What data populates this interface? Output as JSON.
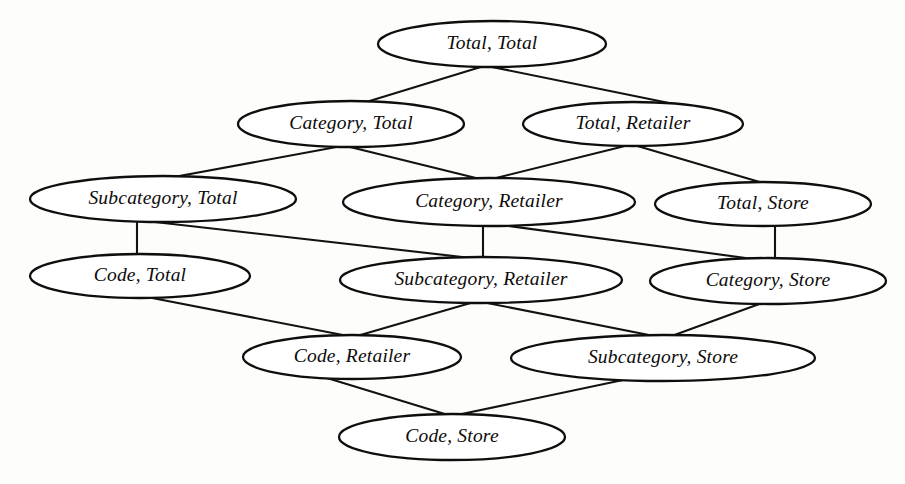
{
  "diagram": {
    "type": "lattice-dag",
    "orientation": "top-down",
    "background_color": "#fdfdfb",
    "node_fill": "#ffffff",
    "node_stroke": "#100e0c",
    "edge_stroke": "#14120f",
    "node_shape": "ellipse",
    "text_style": "italic-serif",
    "levels": 6,
    "node_count": 12,
    "edge_count": 17,
    "dimensions": [
      "Product",
      "Location"
    ],
    "nodes": [
      {
        "id": "total-total",
        "label": "Total, Total",
        "level": 0,
        "cx": 492,
        "cy": 44,
        "rx": 114,
        "ry": 23
      },
      {
        "id": "category-total",
        "label": "Category, Total",
        "level": 1,
        "cx": 351,
        "cy": 124,
        "rx": 113,
        "ry": 23
      },
      {
        "id": "total-retailer",
        "label": "Total, Retailer",
        "level": 1,
        "cx": 633,
        "cy": 124,
        "rx": 110,
        "ry": 22
      },
      {
        "id": "subcategory-total",
        "label": "Subcategory, Total",
        "level": 2,
        "cx": 163,
        "cy": 199,
        "rx": 133,
        "ry": 23
      },
      {
        "id": "category-retailer",
        "label": "Category, Retailer",
        "level": 2,
        "cx": 489,
        "cy": 202,
        "rx": 146,
        "ry": 24
      },
      {
        "id": "total-store",
        "label": "Total, Store",
        "level": 2,
        "cx": 763,
        "cy": 204,
        "rx": 108,
        "ry": 22
      },
      {
        "id": "code-total",
        "label": "Code, Total",
        "level": 3,
        "cx": 140,
        "cy": 276,
        "rx": 110,
        "ry": 22
      },
      {
        "id": "subcategory-retailer",
        "label": "Subcategory, Retailer",
        "level": 3,
        "cx": 481,
        "cy": 280,
        "rx": 141,
        "ry": 23
      },
      {
        "id": "category-store",
        "label": "Category, Store",
        "level": 3,
        "cx": 768,
        "cy": 281,
        "rx": 118,
        "ry": 23
      },
      {
        "id": "code-retailer",
        "label": "Code, Retailer",
        "level": 4,
        "cx": 352,
        "cy": 357,
        "rx": 109,
        "ry": 22
      },
      {
        "id": "subcategory-store",
        "label": "Subcategory, Store",
        "level": 4,
        "cx": 663,
        "cy": 358,
        "rx": 152,
        "ry": 23
      },
      {
        "id": "code-store",
        "label": "Code, Store",
        "level": 5,
        "cx": 452,
        "cy": 437,
        "rx": 113,
        "ry": 23
      }
    ],
    "edges": [
      {
        "from": "total-total",
        "to": "category-total",
        "x1": 484,
        "y1": 66,
        "x2": 363,
        "y2": 103
      },
      {
        "from": "total-total",
        "to": "total-retailer",
        "x1": 487,
        "y1": 66,
        "x2": 669,
        "y2": 103
      },
      {
        "from": "category-total",
        "to": "subcategory-total",
        "x1": 342,
        "y1": 146,
        "x2": 163,
        "y2": 179
      },
      {
        "from": "category-total",
        "to": "category-retailer",
        "x1": 346,
        "y1": 146,
        "x2": 484,
        "y2": 180
      },
      {
        "from": "total-retailer",
        "to": "category-retailer",
        "x1": 629,
        "y1": 145,
        "x2": 492,
        "y2": 179
      },
      {
        "from": "total-retailer",
        "to": "total-store",
        "x1": 634,
        "y1": 145,
        "x2": 763,
        "y2": 183
      },
      {
        "from": "subcategory-total",
        "to": "code-total",
        "x1": 137,
        "y1": 221,
        "x2": 137,
        "y2": 255
      },
      {
        "from": "subcategory-total",
        "to": "subcategory-retailer",
        "x1": 146,
        "y1": 221,
        "x2": 471,
        "y2": 258
      },
      {
        "from": "category-retailer",
        "to": "subcategory-retailer",
        "x1": 483,
        "y1": 225,
        "x2": 483,
        "y2": 258
      },
      {
        "from": "category-retailer",
        "to": "category-store",
        "x1": 494,
        "y1": 224,
        "x2": 753,
        "y2": 259
      },
      {
        "from": "total-store",
        "to": "category-store",
        "x1": 775,
        "y1": 226,
        "x2": 775,
        "y2": 259
      },
      {
        "from": "code-total",
        "to": "code-retailer",
        "x1": 147,
        "y1": 297,
        "x2": 348,
        "y2": 336
      },
      {
        "from": "subcategory-retailer",
        "to": "code-retailer",
        "x1": 474,
        "y1": 302,
        "x2": 357,
        "y2": 336
      },
      {
        "from": "subcategory-retailer",
        "to": "subcategory-store",
        "x1": 482,
        "y1": 302,
        "x2": 659,
        "y2": 337
      },
      {
        "from": "category-store",
        "to": "subcategory-store",
        "x1": 762,
        "y1": 303,
        "x2": 669,
        "y2": 337
      },
      {
        "from": "code-retailer",
        "to": "code-store",
        "x1": 327,
        "y1": 378,
        "x2": 448,
        "y2": 415
      },
      {
        "from": "subcategory-store",
        "to": "code-store",
        "x1": 623,
        "y1": 380,
        "x2": 457,
        "y2": 415
      }
    ]
  }
}
